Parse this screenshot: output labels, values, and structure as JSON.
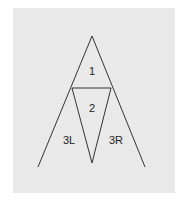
{
  "diagram": {
    "background_color": "#e9e9e9",
    "line_color": "#333333",
    "points": {
      "apex": [
        92,
        36
      ],
      "left_mid": [
        72,
        88
      ],
      "right_mid": [
        111,
        88
      ],
      "bottom_vertex": [
        92,
        163
      ],
      "left_base": [
        38,
        167
      ],
      "right_base": [
        145,
        167
      ]
    },
    "labels": {
      "region_1": "1",
      "region_2": "2",
      "region_3l": "3L",
      "region_3r": "3R"
    }
  }
}
